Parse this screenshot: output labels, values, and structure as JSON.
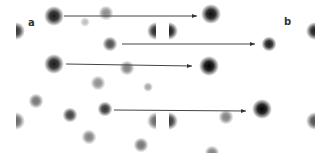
{
  "figure": {
    "panels": [
      {
        "label": "a"
      },
      {
        "label": "b"
      }
    ],
    "colors": {
      "background": "#ffffff",
      "arrow": "#444444",
      "spot_dark": "#000000"
    },
    "spots": [
      {
        "panel": "a",
        "x": 54,
        "y": 16,
        "intensity": 0.9,
        "size": "large"
      },
      {
        "panel": "a",
        "x": 85,
        "y": 22,
        "intensity": 0.25,
        "size": "small"
      },
      {
        "panel": "a",
        "x": 106,
        "y": 13,
        "intensity": 0.45,
        "size": "medium"
      },
      {
        "panel": "a",
        "x": 110,
        "y": 44,
        "intensity": 0.7,
        "size": "medium"
      },
      {
        "panel": "a",
        "x": 54,
        "y": 64,
        "intensity": 0.9,
        "size": "large"
      },
      {
        "panel": "a",
        "x": 127,
        "y": 68,
        "intensity": 0.5,
        "size": "medium"
      },
      {
        "panel": "a",
        "x": 98,
        "y": 83,
        "intensity": 0.45,
        "size": "medium"
      },
      {
        "panel": "a",
        "x": 148,
        "y": 87,
        "intensity": 0.35,
        "size": "small"
      },
      {
        "panel": "a",
        "x": 36,
        "y": 101,
        "intensity": 0.55,
        "size": "medium"
      },
      {
        "panel": "a",
        "x": 70,
        "y": 115,
        "intensity": 0.75,
        "size": "medium"
      },
      {
        "panel": "a",
        "x": 105,
        "y": 109,
        "intensity": 0.8,
        "size": "medium"
      },
      {
        "panel": "a",
        "x": 89,
        "y": 137,
        "intensity": 0.5,
        "size": "medium"
      },
      {
        "panel": "a",
        "x": 141,
        "y": 145,
        "intensity": 0.55,
        "size": "medium"
      },
      {
        "panel": "b",
        "x": 211,
        "y": 14,
        "intensity": 0.95,
        "size": "large"
      },
      {
        "panel": "b",
        "x": 269,
        "y": 44,
        "intensity": 0.9,
        "size": "medium"
      },
      {
        "panel": "b",
        "x": 209,
        "y": 66,
        "intensity": 1.0,
        "size": "large"
      },
      {
        "panel": "b",
        "x": 226,
        "y": 117,
        "intensity": 0.5,
        "size": "medium"
      },
      {
        "panel": "b",
        "x": 262,
        "y": 109,
        "intensity": 1.0,
        "size": "large"
      },
      {
        "panel": "b",
        "x": 212,
        "y": 153,
        "intensity": 0.5,
        "size": "medium"
      }
    ],
    "clipped_spots": [
      {
        "x": 20,
        "y": 31,
        "side": "left",
        "intensity": 0.8
      },
      {
        "x": 20,
        "y": 121,
        "side": "left",
        "intensity": 0.6
      },
      {
        "x": 152,
        "y": 31,
        "side": "right",
        "intensity": 0.85
      },
      {
        "x": 152,
        "y": 121,
        "side": "right",
        "intensity": 0.6
      },
      {
        "x": 173,
        "y": 31,
        "side": "left",
        "intensity": 0.9
      },
      {
        "x": 173,
        "y": 121,
        "side": "left",
        "intensity": 0.8
      },
      {
        "x": 311,
        "y": 31,
        "side": "right",
        "intensity": 0.9
      },
      {
        "x": 311,
        "y": 121,
        "side": "right",
        "intensity": 0.7
      }
    ],
    "arrows": [
      {
        "x1": 64,
        "y1": 16,
        "x2": 197,
        "y2": 16
      },
      {
        "x1": 122,
        "y1": 44,
        "x2": 255,
        "y2": 44
      },
      {
        "x1": 66,
        "y1": 64,
        "x2": 192,
        "y2": 66
      },
      {
        "x1": 114,
        "y1": 110,
        "x2": 246,
        "y2": 111
      }
    ]
  }
}
